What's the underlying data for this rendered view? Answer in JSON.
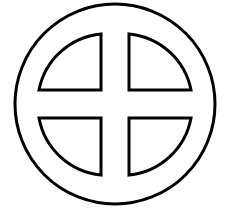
{
  "symbol": {
    "name": "sun-cross",
    "stroke_color": "#000000",
    "fill_color": "#ffffff",
    "quadrants": [
      "top-left",
      "top-right",
      "bottom-left",
      "bottom-right"
    ]
  }
}
